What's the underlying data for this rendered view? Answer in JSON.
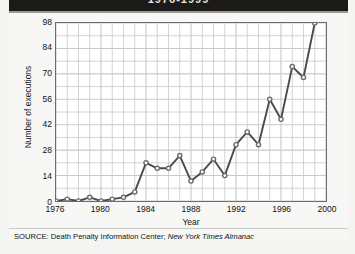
{
  "banner": {
    "title": "1976-1999"
  },
  "source": {
    "prefix": "SOURCE: Death Penalty Information Center;",
    "publication": "New York Times Almanac"
  },
  "chart_data": {
    "type": "line",
    "title": "",
    "xlabel": "Year",
    "ylabel": "Number of executions",
    "xlim": [
      1976,
      2000
    ],
    "ylim": [
      0,
      98
    ],
    "yticks": [
      0,
      14,
      28,
      42,
      56,
      70,
      84,
      98
    ],
    "xticks": [
      1976,
      1980,
      1984,
      1988,
      1992,
      1996,
      2000
    ],
    "grid": true,
    "legend": "none",
    "marker": "circle",
    "line_color": "#4a4a4a",
    "marker_color": "#6b6b6b",
    "grid_color": "#c9c9c9",
    "axis_color": "#6d6d6d",
    "x": [
      1976,
      1977,
      1978,
      1979,
      1980,
      1981,
      1982,
      1983,
      1984,
      1985,
      1986,
      1987,
      1988,
      1989,
      1990,
      1991,
      1992,
      1993,
      1994,
      1995,
      1996,
      1997,
      1998,
      1999
    ],
    "values": [
      0,
      1,
      0,
      2,
      0,
      1,
      2,
      5,
      21,
      18,
      18,
      25,
      11,
      16,
      23,
      14,
      31,
      38,
      31,
      56,
      45,
      74,
      68,
      98
    ],
    "series": [
      {
        "name": "Number of executions",
        "values": [
          0,
          1,
          0,
          2,
          0,
          1,
          2,
          5,
          21,
          18,
          18,
          25,
          11,
          16,
          23,
          14,
          31,
          38,
          31,
          56,
          45,
          74,
          68,
          98
        ]
      }
    ]
  }
}
